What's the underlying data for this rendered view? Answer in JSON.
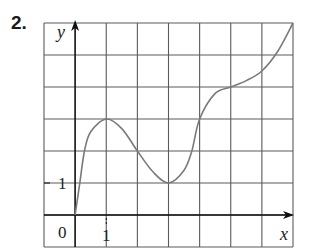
{
  "problem": {
    "number_label": "2."
  },
  "chart_data": {
    "type": "line",
    "title": "",
    "xlabel": "x",
    "ylabel": "y",
    "xlim": [
      -1,
      7
    ],
    "ylim": [
      -1,
      6
    ],
    "grid": true,
    "grid_step": 1,
    "tick_labels": {
      "origin": "0",
      "x": [
        "1"
      ],
      "y": [
        "1"
      ]
    },
    "series": [
      {
        "name": "f(x)",
        "x": [
          0,
          0.15,
          0.3,
          0.5,
          1,
          1.5,
          2,
          2.5,
          3,
          3.5,
          3.75,
          4,
          4.5,
          5,
          5.5,
          6,
          6.5,
          7
        ],
        "y": [
          0,
          1,
          2,
          2.6,
          3,
          2.7,
          2,
          1.35,
          1,
          1.4,
          2,
          3,
          3.8,
          4,
          4.2,
          4.5,
          5.1,
          6
        ]
      }
    ],
    "key_points": [
      {
        "label": "start",
        "x": 0,
        "y": 0
      },
      {
        "label": "local max",
        "x": 1,
        "y": 3
      },
      {
        "label": "local min",
        "x": 3,
        "y": 1
      },
      {
        "label": "inflection plateau",
        "x": 5,
        "y": 4
      },
      {
        "label": "end",
        "x": 7,
        "y": 6
      }
    ]
  },
  "colors": {
    "grid": "#5a5a5a",
    "axes": "#111111",
    "curve": "#7a7a7a"
  }
}
